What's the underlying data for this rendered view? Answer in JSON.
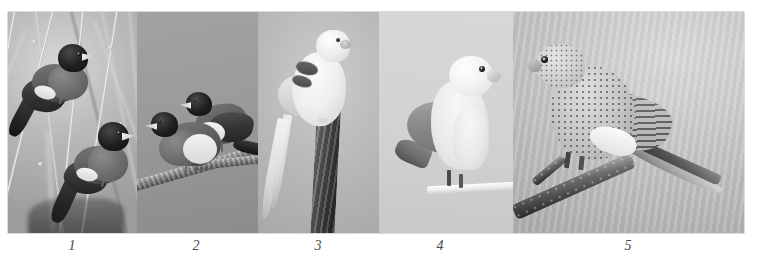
{
  "plate": {
    "background_color": "#ffffff",
    "border_color": "#b6b6b6",
    "panel_count": 5,
    "caption_color": "#4a4a4a"
  },
  "panels": [
    {
      "number": "1",
      "caption": "1",
      "caption_x": 72,
      "subject": "two black-headed munia finches perched on reed stems",
      "background_tone": "#b8b7b1",
      "bird_count": 2
    },
    {
      "number": "2",
      "caption": "2",
      "caption_x": 196,
      "subject": "pair of black-headed finches perched together on a branch",
      "background_tone": "#9a9997",
      "bird_count": 2
    },
    {
      "number": "3",
      "caption": "3",
      "caption_x": 318,
      "subject": "pale long-tailed parakeet on a vertical branch",
      "background_tone": "#bcbbb5",
      "bird_count": 1
    },
    {
      "number": "4",
      "caption": "4",
      "caption_x": 440,
      "subject": "lovebird parrot perched on a white dowel perch",
      "background_tone": "#d2d1cc",
      "bird_count": 1
    },
    {
      "number": "5",
      "caption": "5",
      "caption_x": 628,
      "subject": "speckled parakeet on a diagonal branch",
      "background_tone": "#c7c6c1",
      "bird_count": 1
    }
  ]
}
